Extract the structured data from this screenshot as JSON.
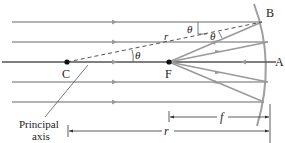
{
  "diagram": {
    "colors": {
      "ray": "#9a9a9a",
      "axis": "#555555",
      "mirror": "#a0a0a0",
      "dashed": "#555555",
      "text": "#222222"
    },
    "points": {
      "C": {
        "label": "C"
      },
      "F": {
        "label": "F"
      },
      "A": {
        "label": "A"
      },
      "B": {
        "label": "B"
      }
    },
    "angle_labels": [
      "θ",
      "θ",
      "θ"
    ],
    "radius_label": "r",
    "principal_axis_label_line1": "Principal",
    "principal_axis_label_line2": "axis",
    "dimensions": {
      "focal_length": {
        "label": "f"
      },
      "radius": {
        "label": "r"
      }
    },
    "incoming_rays_count": 5
  }
}
